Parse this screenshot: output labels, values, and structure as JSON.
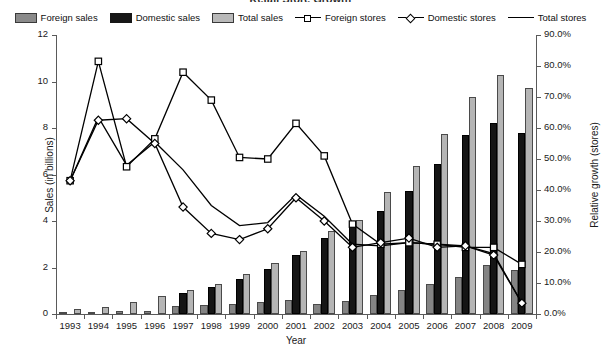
{
  "title": "Retail Store Growth",
  "legend": {
    "position": "top-center",
    "items": [
      {
        "label": "Foreign sales",
        "type": "bar",
        "icon": "bar-swatch-foreign",
        "color": "#848484"
      },
      {
        "label": "Domestic sales",
        "type": "bar",
        "icon": "bar-swatch-domestic",
        "color": "#151515"
      },
      {
        "label": "Total sales",
        "type": "bar",
        "icon": "bar-swatch-total",
        "color": "#b5b5b5"
      },
      {
        "label": "Foreign stores",
        "type": "line",
        "icon": "line-square-marker",
        "color": "#000000"
      },
      {
        "label": "Domestic stores",
        "type": "line",
        "icon": "line-diamond-marker",
        "color": "#000000"
      },
      {
        "label": "Total stores",
        "type": "line",
        "icon": "line-plain",
        "color": "#000000"
      }
    ]
  },
  "chart_data": {
    "type": "bar",
    "title": "Retail Store Growth",
    "xlabel": "Year",
    "ylabel": "Sales (in billions)",
    "y2label": "Relative growth (stores)",
    "grid": false,
    "categories": [
      "1993",
      "1994",
      "1995",
      "1996",
      "1997",
      "1998",
      "1999",
      "2000",
      "2001",
      "2002",
      "2003",
      "2004",
      "2005",
      "2006",
      "2007",
      "2008",
      "2009"
    ],
    "ylim": [
      0,
      12
    ],
    "yticks": [
      0,
      2,
      4,
      6,
      8,
      10,
      12
    ],
    "yticklabels": [
      "0",
      "2",
      "4",
      "6",
      "8",
      "10",
      "12"
    ],
    "y2lim": [
      0,
      90
    ],
    "y2ticks": [
      0,
      10,
      20,
      30,
      40,
      50,
      60,
      70,
      80,
      90
    ],
    "y2ticklabels": [
      "0.0%",
      "10.0%",
      "20.0%",
      "30.0%",
      "40.0%",
      "50.0%",
      "60.0%",
      "70.0%",
      "80.0%",
      "90.0%"
    ],
    "xticklabels": [
      "1993",
      "1994",
      "1995",
      "1996",
      "1997",
      "1998",
      "1999",
      "2000",
      "2001",
      "2002",
      "2003",
      "2004",
      "2005",
      "2006",
      "2007",
      "2008",
      "2009"
    ],
    "series": [
      {
        "name": "Foreign sales",
        "axis": "left",
        "kind": "bar",
        "color": "#848484",
        "values": [
          0.08,
          0.1,
          0.12,
          0.15,
          0.35,
          0.4,
          0.45,
          0.5,
          0.62,
          0.42,
          0.55,
          0.82,
          1.05,
          1.28,
          1.6,
          2.1,
          1.9
        ]
      },
      {
        "name": "Domestic sales",
        "axis": "left",
        "kind": "bar",
        "color": "#151515",
        "values": [
          0.0,
          0.0,
          0.0,
          0.0,
          0.9,
          1.15,
          1.5,
          1.95,
          2.55,
          3.25,
          4.0,
          4.45,
          5.3,
          6.45,
          7.7,
          8.2,
          7.8
        ]
      },
      {
        "name": "Total sales",
        "axis": "left",
        "kind": "bar",
        "color": "#b5b5b5",
        "values": [
          0.2,
          0.32,
          0.52,
          0.78,
          1.05,
          1.3,
          1.72,
          2.18,
          2.72,
          3.55,
          4.05,
          5.25,
          6.35,
          7.75,
          9.35,
          10.3,
          9.7
        ]
      },
      {
        "name": "Foreign stores",
        "axis": "right",
        "kind": "line",
        "marker": "square",
        "color": "#000000",
        "values": [
          43.0,
          81.5,
          47.5,
          56.5,
          78.0,
          69.0,
          50.5,
          50.0,
          61.5,
          51.0,
          29.0,
          22.5,
          23.0,
          22.5,
          21.5,
          21.5,
          16.0
        ]
      },
      {
        "name": "Domestic stores",
        "axis": "right",
        "kind": "line",
        "marker": "diamond",
        "color": "#000000",
        "values": [
          43.0,
          62.5,
          63.0,
          55.0,
          34.5,
          26.0,
          24.0,
          27.5,
          37.5,
          30.0,
          21.5,
          23.0,
          24.5,
          21.5,
          22.0,
          19.0,
          3.5
        ]
      },
      {
        "name": "Total stores",
        "axis": "right",
        "kind": "line",
        "marker": "none",
        "color": "#000000",
        "values": [
          43.0,
          63.5,
          48.0,
          55.5,
          46.5,
          35.0,
          28.5,
          29.5,
          38.5,
          31.5,
          22.5,
          22.0,
          23.0,
          22.5,
          22.0,
          19.5,
          3.5
        ]
      }
    ]
  }
}
